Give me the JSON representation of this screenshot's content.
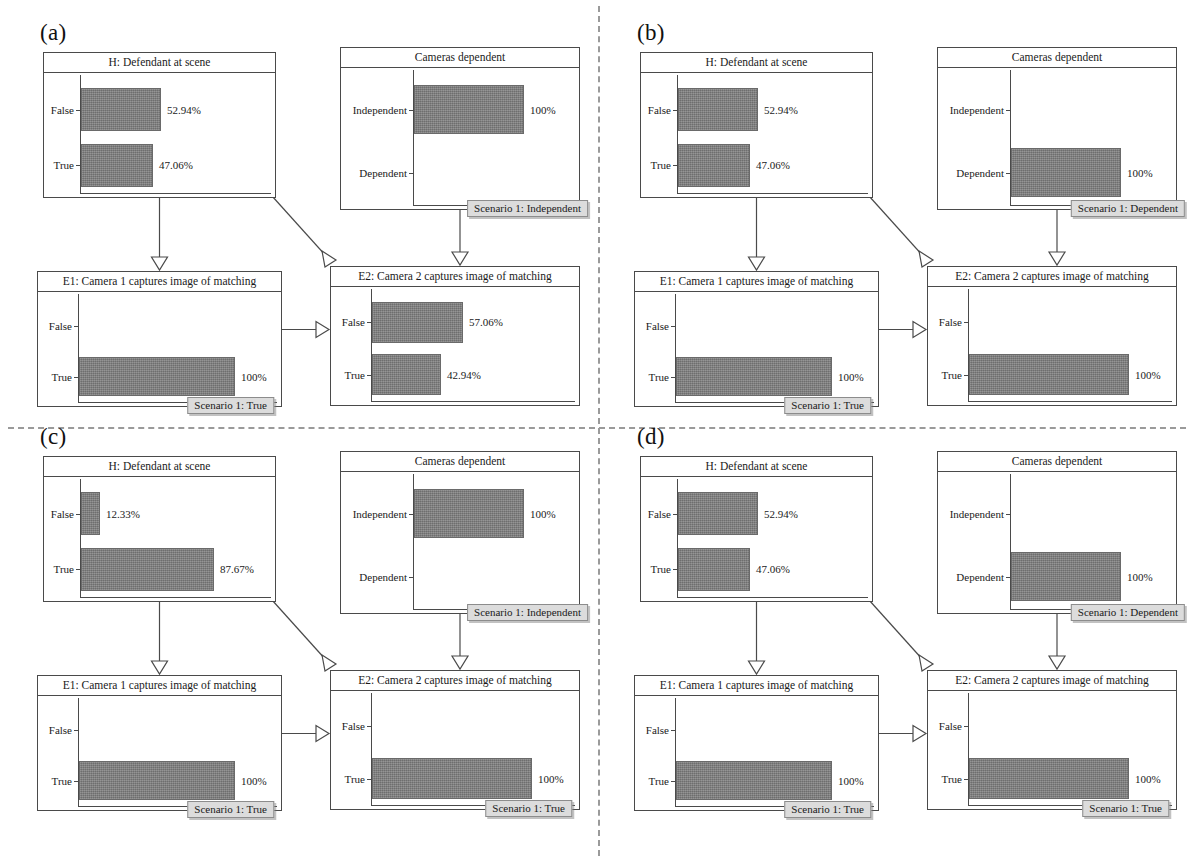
{
  "figure": {
    "type": "diagram",
    "panels": [
      {
        "id": "a",
        "label": "(a)",
        "nodes": [
          {
            "key": "H",
            "title": "H: Defendant at scene",
            "categories": [
              "False",
              "True"
            ],
            "values": [
              52.94,
              47.06
            ],
            "value_labels": [
              "52.94%",
              "47.06%"
            ],
            "badge": null
          },
          {
            "key": "CAM",
            "title": "Cameras dependent",
            "categories": [
              "Independent",
              "Dependent"
            ],
            "values": [
              100,
              0
            ],
            "value_labels": [
              "100%",
              ""
            ],
            "badge": "Scenario 1: Independent"
          },
          {
            "key": "E1",
            "title": "E1:  Camera 1 captures image of matching",
            "categories": [
              "False",
              "True"
            ],
            "values": [
              0,
              100
            ],
            "value_labels": [
              "",
              "100%"
            ],
            "badge": "Scenario 1: True"
          },
          {
            "key": "E2",
            "title": "E2:  Camera 2 captures image of matching",
            "categories": [
              "False",
              "True"
            ],
            "values": [
              57.06,
              42.94
            ],
            "value_labels": [
              "57.06%",
              "42.94%"
            ],
            "badge": null
          }
        ]
      },
      {
        "id": "b",
        "label": "(b)",
        "nodes": [
          {
            "key": "H",
            "title": "H: Defendant at scene",
            "categories": [
              "False",
              "True"
            ],
            "values": [
              52.94,
              47.06
            ],
            "value_labels": [
              "52.94%",
              "47.06%"
            ],
            "badge": null
          },
          {
            "key": "CAM",
            "title": "Cameras dependent",
            "categories": [
              "Independent",
              "Dependent"
            ],
            "values": [
              0,
              100
            ],
            "value_labels": [
              "",
              "100%"
            ],
            "badge": "Scenario 1: Dependent"
          },
          {
            "key": "E1",
            "title": "E1:  Camera 1 captures image of matching",
            "categories": [
              "False",
              "True"
            ],
            "values": [
              0,
              100
            ],
            "value_labels": [
              "",
              "100%"
            ],
            "badge": "Scenario 1: True"
          },
          {
            "key": "E2",
            "title": "E2:  Camera 2 captures image of matching",
            "categories": [
              "False",
              "True"
            ],
            "values": [
              0,
              100
            ],
            "value_labels": [
              "",
              "100%"
            ],
            "badge": null
          }
        ]
      },
      {
        "id": "c",
        "label": "(c)",
        "nodes": [
          {
            "key": "H",
            "title": "H: Defendant at scene",
            "categories": [
              "False",
              "True"
            ],
            "values": [
              12.33,
              87.67
            ],
            "value_labels": [
              "12.33%",
              "87.67%"
            ],
            "badge": null
          },
          {
            "key": "CAM",
            "title": "Cameras dependent",
            "categories": [
              "Independent",
              "Dependent"
            ],
            "values": [
              100,
              0
            ],
            "value_labels": [
              "100%",
              ""
            ],
            "badge": "Scenario 1: Independent"
          },
          {
            "key": "E1",
            "title": "E1:  Camera 1 captures image of matching",
            "categories": [
              "False",
              "True"
            ],
            "values": [
              0,
              100
            ],
            "value_labels": [
              "",
              "100%"
            ],
            "badge": "Scenario 1: True"
          },
          {
            "key": "E2",
            "title": "E2:  Camera 2 captures image of matching",
            "categories": [
              "False",
              "True"
            ],
            "values": [
              0,
              100
            ],
            "value_labels": [
              "",
              "100%"
            ],
            "badge": "Scenario 1: True"
          }
        ]
      },
      {
        "id": "d",
        "label": "(d)",
        "nodes": [
          {
            "key": "H",
            "title": "H: Defendant at scene",
            "categories": [
              "False",
              "True"
            ],
            "values": [
              52.94,
              47.06
            ],
            "value_labels": [
              "52.94%",
              "47.06%"
            ],
            "badge": null
          },
          {
            "key": "CAM",
            "title": "Cameras dependent",
            "categories": [
              "Independent",
              "Dependent"
            ],
            "values": [
              0,
              100
            ],
            "value_labels": [
              "",
              "100%"
            ],
            "badge": "Scenario 1: Dependent"
          },
          {
            "key": "E1",
            "title": "E1:  Camera 1 captures image of matching",
            "categories": [
              "False",
              "True"
            ],
            "values": [
              0,
              100
            ],
            "value_labels": [
              "",
              "100%"
            ],
            "badge": "Scenario 1: True"
          },
          {
            "key": "E2",
            "title": "E2:  Camera 2 captures image of matching",
            "categories": [
              "False",
              "True"
            ],
            "values": [
              0,
              100
            ],
            "value_labels": [
              "",
              "100%"
            ],
            "badge": "Scenario 1: True"
          }
        ]
      }
    ]
  },
  "colors": {
    "bar_fill": "#7d7d7d",
    "node_border": "#4a4a4a",
    "badge_bg": "#dcdcdc",
    "divider": "#9a9a9a"
  }
}
